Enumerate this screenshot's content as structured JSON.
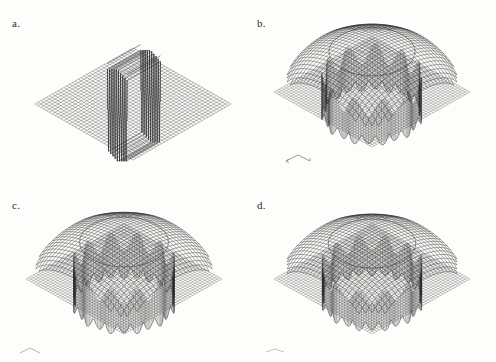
{
  "figure": {
    "background_color": "#fdfdfb",
    "ink_color": "#2b2b2b",
    "layout": "2x2 grid of 3D wireframe surface plots",
    "panels": [
      {
        "id": "a",
        "label": "a.",
        "kind": "flat-plane-with-central-oscillation",
        "axis_marker": false
      },
      {
        "id": "b",
        "label": "b.",
        "kind": "dome-with-fringe-skirt",
        "axis_marker": true
      },
      {
        "id": "c",
        "label": "c.",
        "kind": "dome-with-fringe-skirt",
        "axis_marker": true
      },
      {
        "id": "d",
        "label": "d.",
        "kind": "dome-with-fringe-skirt",
        "axis_marker": true
      }
    ]
  },
  "chart_data": [
    {
      "type": "surface",
      "panel": "a",
      "title": "a.",
      "xlabel": "",
      "ylabel": "",
      "zlabel": "",
      "grid": true,
      "legend": "none",
      "description": "Flat square mesh plane viewed in isometric projection, rendered as a diamond. A narrow rectangular band near the centre carries a high-frequency oscillation of alternating tall positive and negative spikes (approximately 9 ridges), resembling a square-wave / sinc ringing artefact. Everything outside the band is identically zero.",
      "grid_n": 46,
      "baseline_z": 0,
      "feature": {
        "name": "central oscillating band",
        "peaks": 9,
        "amplitude": 1.0,
        "band_u_range": [
          0.42,
          0.62
        ],
        "band_v_range": [
          0.34,
          0.68
        ]
      },
      "values": [
        0,
        0,
        0,
        0,
        0,
        0,
        0,
        0,
        0,
        0,
        0,
        0,
        0,
        0,
        0,
        0,
        0,
        0,
        0,
        1,
        -1,
        1,
        -1,
        1,
        -1,
        1,
        -1,
        1,
        0,
        0,
        0,
        0,
        0,
        0,
        0,
        0,
        0,
        0,
        0,
        0,
        0,
        0,
        0,
        0,
        0,
        0
      ]
    },
    {
      "type": "surface",
      "panel": "b",
      "title": "b.",
      "xlabel": "x",
      "ylabel": "y",
      "zlabel": "",
      "grid": true,
      "legend": "none",
      "description": "Square mesh plane with a large circular dome rising from its centre. The dome rim is surrounded by dense vertical fringe lines (Gibbs-type ringing) that hang below the plane forming a scalloped skirt with roughly 11 lobes along the lower edge.",
      "grid_n": 46,
      "dome_radius_fraction": 0.62,
      "dome_height": 1.0,
      "skirt_lobes": 11,
      "skirt_depth": 0.55,
      "ringing_amplitude": 0.45,
      "radial_profile_r": [
        0.0,
        0.1,
        0.2,
        0.3,
        0.4,
        0.5,
        0.6,
        0.62,
        0.7,
        0.8,
        0.9,
        1.0
      ],
      "radial_profile_z": [
        1.0,
        0.99,
        0.96,
        0.9,
        0.8,
        0.62,
        0.2,
        0.0,
        0.0,
        0.0,
        0.0,
        0.0
      ]
    },
    {
      "type": "surface",
      "panel": "c",
      "title": "c.",
      "xlabel": "x",
      "ylabel": "y",
      "zlabel": "",
      "grid": true,
      "legend": "none",
      "description": "Same square plane and central dome as panel b, with a slightly flatter and broader dome and a marginally denser fringe skirt beneath the rim.",
      "grid_n": 46,
      "dome_radius_fraction": 0.64,
      "dome_height": 0.92,
      "skirt_lobes": 12,
      "skirt_depth": 0.58,
      "ringing_amplitude": 0.4,
      "radial_profile_r": [
        0.0,
        0.1,
        0.2,
        0.3,
        0.4,
        0.5,
        0.6,
        0.64,
        0.7,
        0.8,
        0.9,
        1.0
      ],
      "radial_profile_z": [
        0.92,
        0.91,
        0.89,
        0.84,
        0.75,
        0.58,
        0.22,
        0.0,
        0.0,
        0.0,
        0.0,
        0.0
      ]
    },
    {
      "type": "surface",
      "panel": "d",
      "title": "d.",
      "xlabel": "x",
      "ylabel": "y",
      "zlabel": "",
      "grid": true,
      "legend": "none",
      "description": "Same square plane and central dome as panels b and c; the dome is the smoothest of the three and the hanging fringe skirt is the most regular, with about 12 scalloped lobes.",
      "grid_n": 46,
      "dome_radius_fraction": 0.63,
      "dome_height": 0.88,
      "skirt_lobes": 12,
      "skirt_depth": 0.52,
      "ringing_amplitude": 0.35,
      "radial_profile_r": [
        0.0,
        0.1,
        0.2,
        0.3,
        0.4,
        0.5,
        0.6,
        0.63,
        0.7,
        0.8,
        0.9,
        1.0
      ],
      "radial_profile_z": [
        0.88,
        0.87,
        0.85,
        0.81,
        0.72,
        0.56,
        0.21,
        0.0,
        0.0,
        0.0,
        0.0,
        0.0
      ]
    }
  ]
}
